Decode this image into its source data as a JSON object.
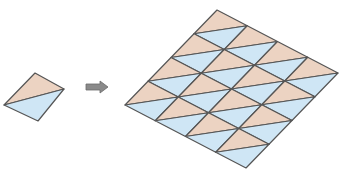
{
  "diagram": {
    "colors": {
      "upper_triangle": "#ecd3c2",
      "lower_triangle": "#cfe6f5",
      "stroke": "#555555",
      "arrow": "#8a8a8a"
    },
    "single_tile": {
      "vertices": {
        "top": [
          35,
          73
        ],
        "right": [
          64,
          89
        ],
        "bottom": [
          38,
          121
        ],
        "left": [
          4,
          105
        ]
      }
    },
    "arrow": {
      "from": [
        86,
        87
      ],
      "to": [
        108,
        87
      ]
    },
    "tiling": {
      "rows": 4,
      "cols": 4,
      "origin_top": [
        217,
        10
      ],
      "step_right": [
        30.25,
        15.75
      ],
      "step_down": [
        -23,
        23.75
      ]
    }
  }
}
